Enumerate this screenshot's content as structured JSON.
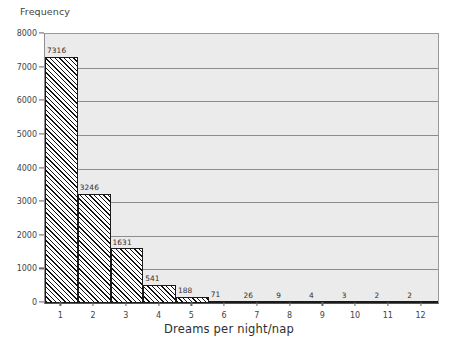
{
  "chart_data": {
    "type": "bar",
    "title": "",
    "xlabel": "Dreams per night/nap",
    "ylabel": "Frequency",
    "categories": [
      "1",
      "2",
      "3",
      "4",
      "5",
      "6",
      "7",
      "8",
      "9",
      "10",
      "11",
      "12"
    ],
    "values": [
      7316,
      3246,
      1631,
      541,
      188,
      71,
      26,
      9,
      4,
      3,
      2,
      2
    ],
    "data_labels": [
      "7316",
      "3246",
      "1631",
      "541",
      "188",
      "71",
      "26",
      "9",
      "4",
      "3",
      "2",
      "2"
    ],
    "ylim": [
      0,
      8000
    ],
    "ytick_labels": [
      "0",
      "1000",
      "2000",
      "3000",
      "4000",
      "5000",
      "6000",
      "7000",
      "8000"
    ],
    "ytick_values": [
      0,
      1000,
      2000,
      3000,
      4000,
      5000,
      6000,
      7000,
      8000
    ],
    "xtick_labels": [
      "1",
      "2",
      "3",
      "4",
      "5",
      "6",
      "7",
      "8",
      "9",
      "10",
      "11",
      "12"
    ],
    "grid": "horizontal",
    "legend": "none",
    "bar_fill": "diagonal-hatch",
    "plot_background": "#ebebeb",
    "page_background": "#ffffff",
    "gridline_color": "#8c8c8c",
    "bar_edge_color": "#1a1a1a"
  }
}
